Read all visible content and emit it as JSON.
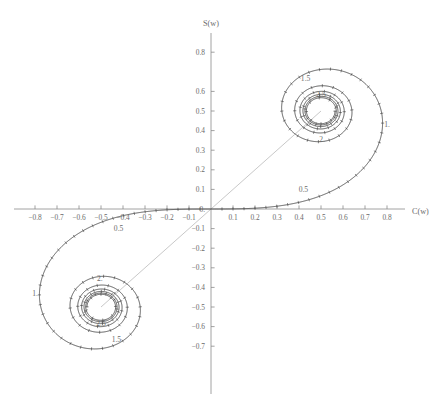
{
  "figure": {
    "kind": "cornu-spiral",
    "xlabel": "C(w)",
    "ylabel": "S(w)",
    "curve_color": "#3d3d3d",
    "axis_color": "#8a8a8a",
    "text_color": "#6b6b6b",
    "chord_color": "#c2c2c2",
    "background": "#ffffff"
  },
  "chart_data": {
    "type": "line",
    "title": "",
    "subtitle": "",
    "xlabel": "C(w)",
    "ylabel": "S(w)",
    "xlim": [
      -0.88,
      0.88
    ],
    "ylim": [
      -0.78,
      0.86
    ],
    "grid": false,
    "legend": "none",
    "parametric": {
      "parameter": "w",
      "parameter_range": [
        -5,
        5
      ],
      "x_expression": "C(w)",
      "y_expression": "S(w)"
    },
    "asymptotic_centers": [
      {
        "label": "upper-right spiral center",
        "x": 0.5,
        "y": 0.5
      },
      {
        "label": "lower-left spiral center",
        "x": -0.5,
        "y": -0.5
      }
    ],
    "series": [
      {
        "name": "Cornu spiral",
        "color": "#3d3d3d",
        "points_w": [
          0.0,
          0.1,
          0.2,
          0.3,
          0.4,
          0.5,
          0.6,
          0.7,
          0.8,
          0.9,
          1.0,
          1.1,
          1.2,
          1.3,
          1.4,
          1.5,
          1.6,
          1.7,
          1.8,
          1.9,
          2.0,
          2.1,
          2.2,
          2.3,
          2.4,
          2.5,
          2.6,
          2.7,
          2.8,
          2.9,
          3.0,
          3.2,
          3.4,
          3.6,
          3.8,
          4.0,
          4.5,
          5.0
        ],
        "points_C": [
          0.0,
          0.1,
          0.19992,
          0.2994,
          0.39748,
          0.49234,
          0.5811,
          0.65965,
          0.72284,
          0.76482,
          0.77989,
          0.76381,
          0.71544,
          0.63855,
          0.5431,
          0.44526,
          0.36546,
          0.32383,
          0.33363,
          0.39447,
          0.48825,
          0.58156,
          0.63629,
          0.62656,
          0.55496,
          0.45742,
          0.38894,
          0.39249,
          0.46749,
          0.56237,
          0.60572,
          0.46632,
          0.43849,
          0.58795,
          0.48825,
          0.49843,
          0.52602,
          0.56363
        ],
        "points_S": [
          0.0,
          0.00052,
          0.00419,
          0.01412,
          0.03336,
          0.06473,
          0.11054,
          0.17214,
          0.24934,
          0.33978,
          0.43826,
          0.5365,
          0.6234,
          0.68633,
          0.71353,
          0.6975,
          0.63889,
          0.5492,
          0.45094,
          0.37335,
          0.34342,
          0.37427,
          0.4557,
          0.55315,
          0.61969,
          0.61918,
          0.54999,
          0.45507,
          0.39153,
          0.40632,
          0.49631,
          0.59335,
          0.42965,
          0.49231,
          0.56562,
          0.42052,
          0.43427,
          0.49919
        ]
      }
    ],
    "xticks": [
      -0.8,
      -0.7,
      -0.6,
      -0.5,
      -0.4,
      -0.3,
      -0.2,
      -0.1,
      0.1,
      0.2,
      0.3,
      0.4,
      0.5,
      0.6,
      0.7,
      0.8
    ],
    "xticklabels": [
      "-0.8",
      "-0.7",
      "-0.6",
      "-0.5",
      "-0.4",
      "-0.3",
      "-0.2",
      "-0.1",
      "0.1",
      "0.2",
      "0.3",
      "0.4",
      "0.5",
      "0.6",
      "0.7",
      "0.8"
    ],
    "yticks": [
      -0.7,
      -0.6,
      -0.5,
      -0.4,
      -0.3,
      -0.2,
      -0.1,
      0.0,
      0.1,
      0.2,
      0.3,
      0.4,
      0.5,
      0.6,
      0.8
    ],
    "yticklabels": [
      "-0.7",
      "-0.6",
      "-0.5",
      "-0.4",
      "-0.3",
      "-0.2",
      "-0.1",
      "0.",
      "0.1",
      "0.2",
      "0.3",
      "0.4",
      "0.5",
      "0.6",
      "0.8"
    ],
    "origin_label": "0.",
    "annotations": [
      {
        "text": "0.5",
        "x": 0.42,
        "y": 0.1,
        "note": "parameter w = 0.5 on upper branch"
      },
      {
        "text": "1.",
        "x": 0.8,
        "y": 0.43,
        "note": "parameter w = 1 on upper branch"
      },
      {
        "text": "1.5",
        "x": 0.43,
        "y": 0.665,
        "note": "parameter w = 1.5 on upper branch"
      },
      {
        "text": "2.",
        "x": 0.505,
        "y": 0.355,
        "note": "parameter w = 2 on upper branch"
      },
      {
        "text": "2.5",
        "x": 0.5,
        "y": 0.585,
        "note": "parameter w = 2.5 on upper branch"
      },
      {
        "text": "0.5",
        "x": -0.42,
        "y": -0.1,
        "note": "parameter w = -0.5 on lower branch"
      },
      {
        "text": "1.",
        "x": -0.8,
        "y": -0.43,
        "note": "parameter w = -1 on lower branch"
      },
      {
        "text": "1.5",
        "x": -0.43,
        "y": -0.665,
        "note": "parameter w = -1.5 on lower branch"
      },
      {
        "text": "2.",
        "x": -0.505,
        "y": -0.355,
        "note": "parameter w = -2 on lower branch"
      },
      {
        "text": "2.5",
        "x": -0.5,
        "y": -0.585,
        "note": "parameter w = -2.5 on lower branch"
      }
    ]
  }
}
